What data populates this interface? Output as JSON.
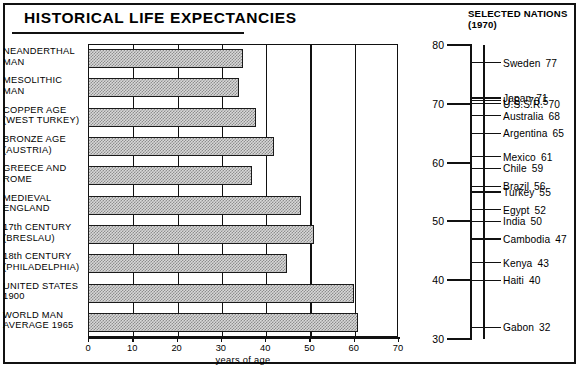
{
  "left_panel": {
    "title": "HISTORICAL LIFE EXPECTANCIES",
    "xlabel": "years of age",
    "xticks": [
      "0",
      "10",
      "20",
      "30",
      "40",
      "50",
      "60",
      "70"
    ]
  },
  "right_panel": {
    "title_line1": "SELECTED NATIONS",
    "title_line2": "(1970)",
    "axis_major_ticks": [
      "80",
      "70",
      "60",
      "50",
      "40",
      "30"
    ]
  },
  "chart_data": {
    "type": "bar",
    "orientation": "horizontal",
    "title": "HISTORICAL LIFE EXPECTANCIES",
    "xlabel": "years of age",
    "ylabel": "",
    "xlim": [
      0,
      70
    ],
    "grid": true,
    "categories": [
      "NEANDERTHAL MAN",
      "MESOLITHIC MAN",
      "COPPER AGE (WEST TURKEY)",
      "BRONZE AGE (AUSTRIA)",
      "GREECE AND ROME",
      "MEDIEVAL ENGLAND",
      "17th CENTURY (BRESLAU)",
      "18th CENTURY (PHILADELPHIA)",
      "UNITED STATES 1900",
      "WORLD MAN AVERAGE 1965"
    ],
    "category_lines": [
      [
        "NEANDERTHAL",
        "MAN"
      ],
      [
        "MESOLITHIC",
        "MAN"
      ],
      [
        "COPPER AGE",
        "(WEST TURKEY)"
      ],
      [
        "BRONZE AGE",
        "(AUSTRIA)"
      ],
      [
        "GREECE AND",
        "ROME"
      ],
      [
        "MEDIEVAL",
        "ENGLAND"
      ],
      [
        "17th CENTURY",
        "(BRESLAU)"
      ],
      [
        "18th CENTURY",
        "(PHILADELPHIA)"
      ],
      [
        "UNITED STATES",
        "1900"
      ],
      [
        "WORLD MAN",
        "AVERAGE 1965"
      ]
    ],
    "values": [
      35,
      34,
      38,
      42,
      37,
      48,
      51,
      45,
      60,
      61
    ]
  },
  "secondary_chart": {
    "type": "scatter",
    "title": "SELECTED NATIONS (1970)",
    "ylabel": "",
    "ylim": [
      30,
      80
    ],
    "yticks": [
      80,
      70,
      60,
      50,
      40,
      30
    ],
    "nations": [
      {
        "name": "Sweden",
        "value": 77,
        "value_text": "77"
      },
      {
        "name": "Japan",
        "value": 71,
        "value_text": "71"
      },
      {
        "name": "U.S.",
        "value": 70.5,
        "value_text": "70.5"
      },
      {
        "name": "U.S.S.R.",
        "value": 70,
        "value_text": "70"
      },
      {
        "name": "Australia",
        "value": 68,
        "value_text": "68"
      },
      {
        "name": "Argentina",
        "value": 65,
        "value_text": "65"
      },
      {
        "name": "Mexico",
        "value": 61,
        "value_text": "61"
      },
      {
        "name": "Chile",
        "value": 59,
        "value_text": "59"
      },
      {
        "name": "Brazil",
        "value": 56,
        "value_text": "56"
      },
      {
        "name": "Turkey",
        "value": 55,
        "value_text": "55"
      },
      {
        "name": "Egypt",
        "value": 52,
        "value_text": "52"
      },
      {
        "name": "India",
        "value": 50,
        "value_text": "50"
      },
      {
        "name": "Cambodia",
        "value": 47,
        "value_text": "47"
      },
      {
        "name": "Kenya",
        "value": 43,
        "value_text": "43"
      },
      {
        "name": "Haiti",
        "value": 40,
        "value_text": "40"
      },
      {
        "name": "Gabon",
        "value": 32,
        "value_text": "32"
      }
    ]
  },
  "colors": {
    "ink": "#111111",
    "bar_fill": "#b9b9b9",
    "background": "#ffffff"
  }
}
